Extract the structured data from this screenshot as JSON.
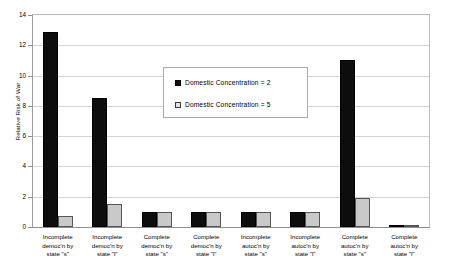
{
  "chart_data": {
    "type": "bar",
    "title": "",
    "xlabel": "",
    "ylabel": "Relative Risk of War",
    "ylim": [
      0,
      14
    ],
    "ytick_step": 2,
    "yticks": [
      0,
      2,
      4,
      6,
      8,
      10,
      12,
      14
    ],
    "grid": true,
    "legend_position": "inside-upper-center",
    "categories": [
      "Incomplete democ'n by state \"s\"",
      "Incomplete democ'n by state \"l\"",
      "Complete democ'n by state \"s\"",
      "Complete democ'n by state \"l\"",
      "Incomplete autoc'n by state \"s\"",
      "Incomplete autoc'n by state \"l\"",
      "Complete autoc'n by state \"s\"",
      "Complete autoc'n by state \"l\""
    ],
    "category_lines": [
      [
        "Incomplete",
        "democ'n by",
        "state \"s\""
      ],
      [
        "Incomplete",
        "democ'n by",
        "state \"l\""
      ],
      [
        "Complete",
        "democ'n by",
        "state \"s\""
      ],
      [
        "Complete",
        "democ'n by",
        "state \"l\""
      ],
      [
        "Incomplete",
        "autoc'n by",
        "state \"s\""
      ],
      [
        "Incomplete",
        "autoc'n by",
        "state \"l\""
      ],
      [
        "Complete",
        "autoc'n by",
        "state \"s\""
      ],
      [
        "Complete",
        "autoc'n by",
        "state \"l\""
      ]
    ],
    "series": [
      {
        "name": "Domestic Concentration = 2",
        "color": "#0d0d0d",
        "values": [
          12.85,
          8.5,
          1.0,
          1.0,
          1.0,
          1.0,
          11.05,
          0.05
        ]
      },
      {
        "name": "Domestic Concentration = 5",
        "color": "#c9c9c9",
        "values": [
          0.75,
          1.5,
          1.0,
          1.0,
          1.0,
          1.0,
          1.9,
          0.05
        ]
      }
    ]
  },
  "legend": {
    "entries": [
      {
        "label": "Domestic Concentration = 2"
      },
      {
        "label": "Domestic Concentration = 5"
      }
    ]
  }
}
